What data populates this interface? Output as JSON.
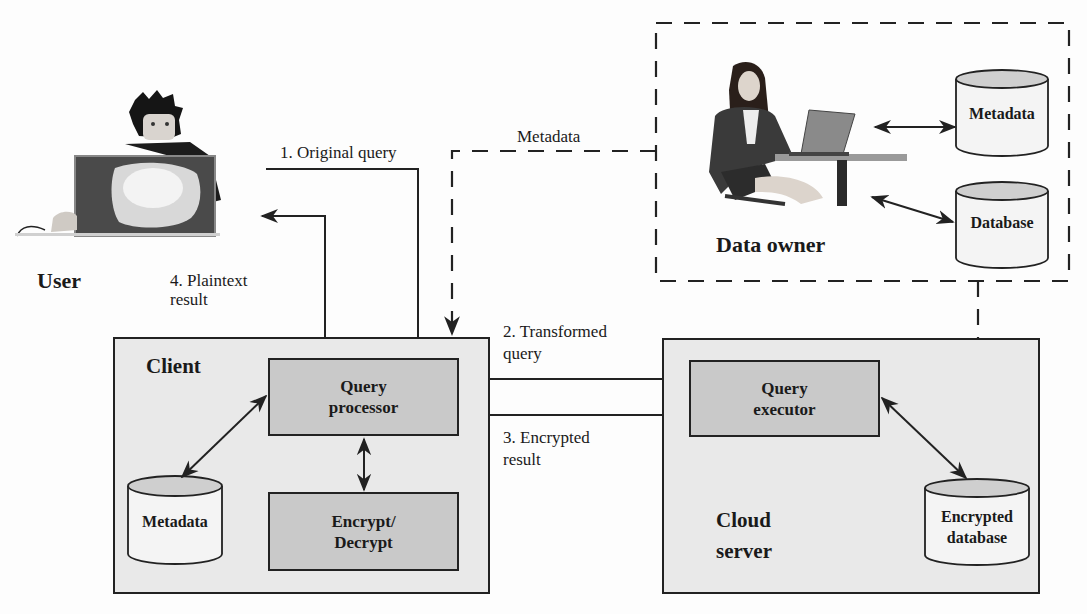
{
  "diagram": {
    "actors": {
      "user": {
        "label": "User"
      },
      "data_owner": {
        "label": "Data owner"
      }
    },
    "client": {
      "label": "Client",
      "query_processor": {
        "line1": "Query",
        "line2": "processor"
      },
      "encrypt_decrypt": {
        "line1": "Encrypt/",
        "line2": "Decrypt"
      },
      "metadata_db": {
        "label": "Metadata"
      }
    },
    "cloud_server": {
      "label_line1": "Cloud",
      "label_line2": "server",
      "query_executor": {
        "line1": "Query",
        "line2": "executor"
      },
      "encrypted_db": {
        "line1": "Encrypted",
        "line2": "database"
      }
    },
    "data_owner_store": {
      "metadata_db": {
        "label": "Metadata"
      },
      "database": {
        "label": "Database"
      }
    },
    "flows": {
      "original_query": "1. Original query",
      "transformed_query_line1": "2. Transformed",
      "transformed_query_line2": "query",
      "encrypted_result_line1": "3. Encrypted",
      "encrypted_result_line2": "result",
      "plaintext_result_line1": "4. Plaintext",
      "plaintext_result_line2": "result",
      "metadata": "Metadata"
    },
    "colors": {
      "container_fill": "#e9e9e9",
      "module_fill": "#c9c9c9",
      "cylinder_top": "#cfcfcf",
      "cylinder_body": "#f4f4f4",
      "line": "#222222"
    }
  }
}
